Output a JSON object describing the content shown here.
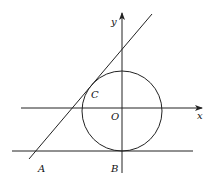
{
  "diagram": {
    "type": "coordinate geometry figure",
    "elements": {
      "x_axis": {
        "label": "x"
      },
      "y_axis": {
        "label": "y"
      },
      "origin": {
        "label": "O"
      },
      "circle": {
        "description": "circle centered at origin O"
      },
      "tangent_line": {
        "description": "slanted line tangent to circle at C, passing through A"
      },
      "horizontal_line": {
        "description": "horizontal line tangent to circle at B"
      }
    },
    "points": [
      {
        "name": "A",
        "label": "A"
      },
      {
        "name": "B",
        "label": "B"
      },
      {
        "name": "C",
        "label": "C"
      },
      {
        "name": "O",
        "label": "O"
      }
    ]
  },
  "colors": {
    "stroke": "#222222",
    "background": "#ffffff"
  }
}
